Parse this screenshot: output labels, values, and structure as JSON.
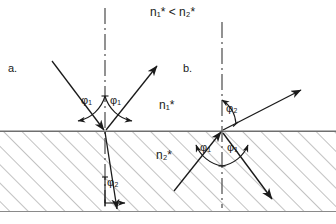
{
  "figure": {
    "header_relation": "n₁* < n₂*",
    "panels": [
      {
        "id": "a",
        "label": "a.",
        "description": "Ray incident from upper medium (optically rarer) onto denser medium: reflection at φ₁ and refraction at smaller angle φ₂",
        "incidence_angle_label": "φ₁",
        "reflection_angle_label": "φ₁",
        "refraction_angle_label": "φ₂"
      },
      {
        "id": "b",
        "label": "b.",
        "description": "Ray incident from lower medium (optically denser) onto rarer medium: reflection at φ₁ and refraction at larger angle φ₂",
        "incidence_angle_label": "φ₁",
        "reflection_angle_label": "φ₁",
        "refraction_angle_label": "φ₂"
      }
    ],
    "media": {
      "upper_index_label": "n₁*",
      "lower_index_label": "n₂*",
      "upper_region_name": "medium-1-upper",
      "lower_region_name": "medium-2-hatched"
    },
    "annotations": {
      "normal_line_name": "surface-normal-dash-dot",
      "interface_line_name": "interface-line",
      "hatching_name": "hatched-medium-fill"
    },
    "colors": {
      "ink": "#1a1a1a",
      "hatch": "#8a8a8a",
      "interface": "#777777",
      "background": "#ffffff"
    }
  }
}
